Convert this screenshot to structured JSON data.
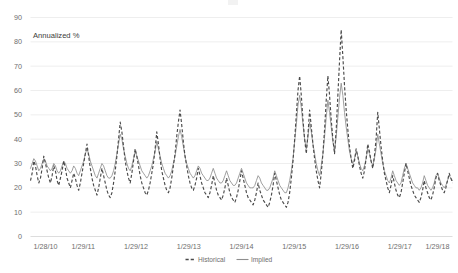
{
  "chart_data": {
    "type": "line",
    "title": "",
    "subtitle": "",
    "xlabel": "",
    "ylabel": "Annualized %",
    "axis_note": "Annualized %",
    "ylim": [
      0,
      90
    ],
    "ytick_step": 10,
    "yticks": [
      "0",
      "10",
      "20",
      "30",
      "40",
      "50",
      "60",
      "70",
      "80",
      "90"
    ],
    "grid": true,
    "grid_axis": "y",
    "legend_position": "bottom-center",
    "xticks": [
      "1/28/10",
      "1/29/11",
      "1/29/12",
      "1/29/13",
      "1/29/14",
      "1/29/15",
      "1/29/16",
      "1/29/17",
      "1/29/18"
    ],
    "x_range": [
      "1/28/10",
      "1/29/18"
    ],
    "colors": {
      "historical": "#4a4a4a",
      "implied": "#8e8e8e",
      "gridline": "#e6e6e6",
      "axis_text": "#6e6e6e",
      "background": "#ffffff"
    },
    "series": [
      {
        "name": "Historical",
        "style": "dashed",
        "color": "#4a4a4a",
        "values": [
          23,
          26,
          31,
          29,
          25,
          22,
          24,
          28,
          33,
          30,
          27,
          24,
          22,
          25,
          29,
          27,
          23,
          21,
          24,
          27,
          31,
          28,
          24,
          22,
          20,
          23,
          26,
          24,
          21,
          19,
          22,
          26,
          30,
          34,
          38,
          33,
          28,
          24,
          21,
          19,
          17,
          20,
          24,
          28,
          25,
          22,
          19,
          17,
          16,
          18,
          22,
          27,
          33,
          40,
          47,
          43,
          37,
          31,
          27,
          24,
          22,
          26,
          31,
          36,
          33,
          29,
          25,
          22,
          20,
          18,
          17,
          19,
          22,
          26,
          30,
          36,
          43,
          38,
          32,
          27,
          24,
          21,
          19,
          18,
          20,
          24,
          29,
          34,
          41,
          47,
          52,
          46,
          39,
          33,
          29,
          25,
          22,
          20,
          19,
          21,
          24,
          28,
          25,
          22,
          20,
          18,
          17,
          16,
          18,
          21,
          25,
          22,
          19,
          17,
          16,
          15,
          17,
          20,
          24,
          21,
          18,
          16,
          15,
          14,
          16,
          19,
          23,
          27,
          24,
          21,
          18,
          16,
          15,
          14,
          13,
          15,
          18,
          22,
          19,
          17,
          15,
          14,
          13,
          12,
          14,
          17,
          21,
          26,
          23,
          20,
          17,
          15,
          14,
          13,
          12,
          14,
          18,
          24,
          31,
          40,
          50,
          60,
          66,
          58,
          48,
          40,
          34,
          42,
          52,
          45,
          38,
          32,
          27,
          23,
          20,
          26,
          34,
          44,
          56,
          66,
          58,
          48,
          40,
          34,
          44,
          58,
          72,
          85,
          74,
          62,
          52,
          44,
          37,
          32,
          28,
          31,
          36,
          33,
          29,
          26,
          24,
          27,
          32,
          38,
          35,
          31,
          28,
          33,
          40,
          51,
          44,
          37,
          31,
          26,
          23,
          20,
          18,
          21,
          25,
          22,
          19,
          17,
          16,
          18,
          22,
          26,
          30,
          27,
          24,
          21,
          19,
          17,
          16,
          15,
          14,
          16,
          19,
          23,
          20,
          18,
          16,
          15,
          17,
          20,
          24,
          26,
          23,
          21,
          19,
          18,
          20,
          23,
          26,
          24,
          22
        ]
      },
      {
        "name": "Implied",
        "style": "solid",
        "color": "#8e8e8e",
        "values": [
          28,
          30,
          32,
          31,
          29,
          27,
          28,
          30,
          32,
          31,
          29,
          28,
          27,
          28,
          30,
          29,
          27,
          26,
          27,
          29,
          31,
          30,
          28,
          27,
          26,
          27,
          29,
          28,
          26,
          25,
          27,
          29,
          31,
          34,
          36,
          34,
          31,
          29,
          27,
          25,
          24,
          26,
          28,
          30,
          29,
          27,
          25,
          24,
          24,
          25,
          27,
          30,
          34,
          38,
          42,
          40,
          36,
          33,
          30,
          28,
          27,
          29,
          32,
          35,
          33,
          31,
          29,
          27,
          26,
          25,
          24,
          25,
          27,
          29,
          32,
          35,
          39,
          36,
          33,
          30,
          28,
          26,
          25,
          24,
          25,
          27,
          30,
          33,
          37,
          41,
          44,
          41,
          37,
          33,
          30,
          28,
          26,
          25,
          24,
          25,
          27,
          29,
          28,
          26,
          25,
          24,
          23,
          23,
          24,
          26,
          28,
          26,
          24,
          23,
          22,
          22,
          23,
          25,
          27,
          25,
          23,
          22,
          21,
          21,
          22,
          24,
          26,
          28,
          26,
          24,
          22,
          21,
          20,
          20,
          20,
          21,
          23,
          25,
          24,
          22,
          21,
          20,
          19,
          19,
          20,
          22,
          24,
          27,
          25,
          23,
          21,
          20,
          19,
          18,
          18,
          20,
          23,
          27,
          32,
          39,
          46,
          54,
          58,
          53,
          46,
          40,
          36,
          41,
          47,
          43,
          38,
          34,
          30,
          27,
          25,
          29,
          34,
          41,
          49,
          56,
          51,
          45,
          39,
          35,
          41,
          49,
          57,
          63,
          58,
          51,
          45,
          40,
          35,
          32,
          30,
          32,
          35,
          33,
          30,
          28,
          27,
          29,
          32,
          36,
          34,
          31,
          29,
          32,
          36,
          42,
          38,
          34,
          30,
          27,
          25,
          23,
          22,
          24,
          27,
          25,
          23,
          22,
          21,
          22,
          25,
          28,
          30,
          28,
          26,
          24,
          22,
          21,
          20,
          20,
          19,
          20,
          22,
          25,
          23,
          21,
          20,
          19,
          20,
          22,
          25,
          26,
          24,
          22,
          21,
          20,
          21,
          23,
          25,
          24,
          23
        ]
      }
    ]
  },
  "legend": {
    "items": [
      {
        "label": "Historical",
        "style": "dashed"
      },
      {
        "label": "Implied",
        "style": "solid"
      }
    ]
  }
}
